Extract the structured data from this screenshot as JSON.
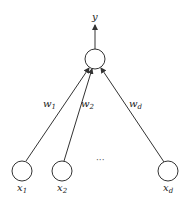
{
  "diagram": {
    "type": "perceptron",
    "output": {
      "label": "y"
    },
    "output_node": {
      "cx": 95,
      "cy": 59,
      "r": 10
    },
    "inputs": [
      {
        "label": "x",
        "sub": "1",
        "cx": 22,
        "cy": 171,
        "weight": "w",
        "weight_sub": "1"
      },
      {
        "label": "x",
        "sub": "2",
        "cx": 62,
        "cy": 171,
        "weight": "w",
        "weight_sub": "2"
      },
      {
        "label": "x",
        "sub": "d",
        "cx": 168,
        "cy": 171,
        "weight": "w",
        "weight_sub": "d"
      }
    ],
    "ellipsis": "···",
    "colors": {
      "stroke": "#333333",
      "background": "#ffffff"
    }
  }
}
